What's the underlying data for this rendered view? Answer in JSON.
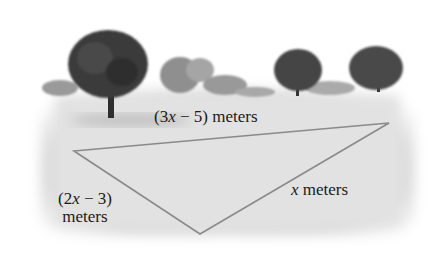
{
  "figure": {
    "sides": [
      {
        "id": "top",
        "label_parts": [
          "(3",
          "x",
          " − 5) meters"
        ]
      },
      {
        "id": "left",
        "label_line1_parts": [
          "(2",
          "x",
          " − 3)"
        ],
        "label_line2": "meters"
      },
      {
        "id": "right",
        "label_parts": [
          "",
          "x",
          " meters"
        ]
      }
    ],
    "triangle_vertices": [
      [
        74,
        151
      ],
      [
        389,
        123
      ],
      [
        200,
        234
      ]
    ],
    "colors": {
      "triangle_stroke": "#8a8a8a",
      "ground": "#e4e4e4",
      "trees": "#3a3a3a"
    }
  }
}
